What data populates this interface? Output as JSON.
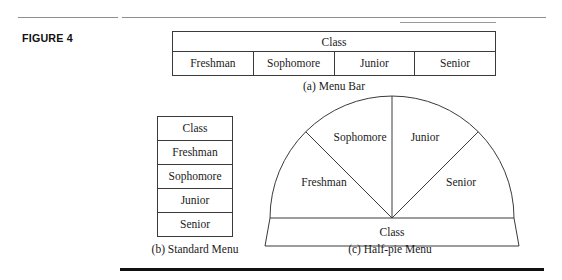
{
  "figure": {
    "label": "FIGURE 4"
  },
  "menu_bar": {
    "title": "Class",
    "items": [
      "Freshman",
      "Sophomore",
      "Junior",
      "Senior"
    ],
    "caption": "(a) Menu Bar"
  },
  "standard_menu": {
    "items": [
      "Class",
      "Freshman",
      "Sophomore",
      "Junior",
      "Senior"
    ],
    "caption": "(b) Standard Menu"
  },
  "half_pie_menu": {
    "base_label": "Class",
    "sectors": [
      "Freshman",
      "Sophomore",
      "Junior",
      "Senior"
    ],
    "caption": "(c) Half-pie Menu"
  },
  "colors": {
    "line": "#3a3a3a",
    "rule_light": "#8e8e8e",
    "rule_dark": "#111111",
    "text": "#1a1a1a",
    "background": "#ffffff"
  }
}
